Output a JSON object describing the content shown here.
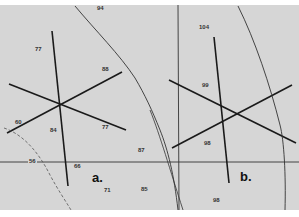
{
  "figure": {
    "panels": [
      {
        "label": "a.",
        "values": [
          "94",
          "77",
          "88",
          "60",
          "84",
          "77",
          "87",
          "56",
          "66",
          "71",
          "85"
        ]
      },
      {
        "label": "b.",
        "values": [
          "104",
          "99",
          "98",
          "98"
        ]
      }
    ],
    "labels": {
      "v94": "94",
      "v77a": "77",
      "v88": "88",
      "v60": "60",
      "v84": "84",
      "v77b": "77",
      "v87": "87",
      "v56": "56",
      "v66": "66",
      "v71": "71",
      "v85": "85",
      "v104": "104",
      "v99": "99",
      "v98a": "98",
      "v98b": "98",
      "panel_a": "a.",
      "panel_b": "b."
    },
    "colors": {
      "background": "#d6d6d6",
      "line": "#1a1a1a"
    }
  }
}
